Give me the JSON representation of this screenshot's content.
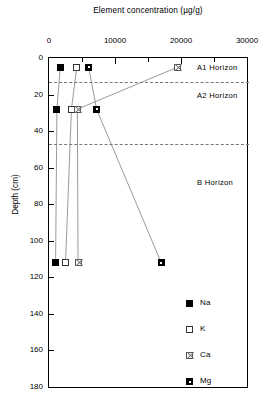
{
  "chart_data": {
    "type": "scatter",
    "title": "Element concentration (µg/g)",
    "xlabel": "Element concentration (µg/g)",
    "ylabel": "Depth (cm)",
    "xlim": [
      0,
      30000
    ],
    "ylim": [
      0,
      180
    ],
    "y_inverted": true,
    "grid": false,
    "legend_position": "bottom-right",
    "xticks": [
      "0",
      "10000",
      "20000",
      "30000"
    ],
    "xtick_values": [
      0,
      10000,
      20000,
      30000
    ],
    "x_minor_tick_values": [
      5000,
      15000,
      25000
    ],
    "yticks": [
      "0",
      "20",
      "40",
      "60",
      "80",
      "100",
      "120",
      "140",
      "160",
      "180"
    ],
    "ytick_values": [
      0,
      20,
      40,
      60,
      80,
      100,
      120,
      140,
      160,
      180
    ],
    "depths": [
      5,
      28,
      112
    ],
    "series": [
      {
        "name": "Na",
        "marker": "filled-square",
        "values": [
          1700,
          1200,
          1000
        ],
        "points": [
          {
            "x": 1700,
            "y": 5
          },
          {
            "x": 1200,
            "y": 28
          },
          {
            "x": 1000,
            "y": 112
          }
        ]
      },
      {
        "name": "K",
        "marker": "open-square",
        "values": [
          4200,
          3400,
          2500
        ],
        "points": [
          {
            "x": 4200,
            "y": 5
          },
          {
            "x": 3400,
            "y": 28
          },
          {
            "x": 2500,
            "y": 112
          }
        ]
      },
      {
        "name": "Ca",
        "marker": "crossed-square",
        "values": [
          19500,
          4300,
          4400
        ],
        "points": [
          {
            "x": 19500,
            "y": 5
          },
          {
            "x": 4300,
            "y": 28
          },
          {
            "x": 4400,
            "y": 112
          }
        ]
      },
      {
        "name": "Mg",
        "marker": "dotted-square",
        "values": [
          6000,
          7200,
          17000
        ],
        "points": [
          {
            "x": 6000,
            "y": 5
          },
          {
            "x": 7200,
            "y": 28
          },
          {
            "x": 17000,
            "y": 112
          }
        ]
      }
    ],
    "annotations": [
      {
        "label": "A1 Horizon",
        "depth_range": [
          0,
          13
        ],
        "label_depth": 5
      },
      {
        "label": "A2 Horizon",
        "depth_range": [
          13,
          47
        ],
        "label_depth": 20
      },
      {
        "label": "B Horizon",
        "depth_range": [
          47,
          180
        ],
        "label_depth": 68
      }
    ],
    "horizon_boundaries": [
      13,
      47
    ]
  },
  "legend": {
    "entries": [
      {
        "label": "Na",
        "marker": "filled-square"
      },
      {
        "label": "K",
        "marker": "open-square"
      },
      {
        "label": "Ca",
        "marker": "crossed-square"
      },
      {
        "label": "Mg",
        "marker": "dotted-square"
      }
    ]
  },
  "colors": {
    "axis": "#000000",
    "line": "#808080",
    "horizon_divider": "#777777",
    "background": "#ffffff"
  }
}
